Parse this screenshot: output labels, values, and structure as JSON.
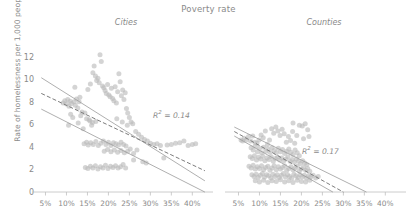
{
  "chart_data": {
    "type": "scatter",
    "title": "Poverty rate",
    "xlabel": "",
    "ylabel": "Rate of homelessness per 1,000 people",
    "xlim": [
      2.5,
      43.5
    ],
    "ylim": [
      -0.4,
      12.8
    ],
    "grid": false,
    "legend": "none",
    "xticks": [
      "5%",
      "10%",
      "15%",
      "20%",
      "25%",
      "30%",
      "35%",
      "40%"
    ],
    "xtick_values": [
      5,
      10,
      15,
      20,
      25,
      30,
      35,
      40
    ],
    "yticks": [
      "0",
      "2",
      "4",
      "6",
      "8",
      "10",
      "12"
    ],
    "ytick_values": [
      0,
      2,
      4,
      6,
      8,
      10,
      12
    ],
    "panels": [
      {
        "name": "cities",
        "label": "Cities",
        "r2_text": "R² = 0.14",
        "r2_value": 0.14,
        "fit_line": {
          "style": "dashed",
          "x": [
            4.0,
            43.0
          ],
          "y": [
            8.75,
            1.85
          ]
        },
        "bound_upper": {
          "style": "solid",
          "x": [
            4.0,
            43.0
          ],
          "y": [
            10.15,
            0.95
          ]
        },
        "bound_lower": {
          "style": "solid",
          "x": [
            4.0,
            43.0
          ],
          "y": [
            7.35,
            -0.05
          ]
        },
        "points": [
          [
            9.2,
            7.9
          ],
          [
            9.6,
            8.1
          ],
          [
            10.0,
            7.8
          ],
          [
            10.3,
            8.2
          ],
          [
            10.6,
            7.6
          ],
          [
            10.9,
            8.05
          ],
          [
            11.2,
            7.85
          ],
          [
            11.5,
            6.6
          ],
          [
            11.8,
            8.0
          ],
          [
            12.1,
            7.7
          ],
          [
            12.4,
            8.25
          ],
          [
            12.7,
            7.45
          ],
          [
            13.0,
            8.0
          ],
          [
            13.4,
            6.75
          ],
          [
            13.7,
            7.1
          ],
          [
            14.0,
            5.6
          ],
          [
            14.4,
            7.0
          ],
          [
            14.8,
            6.5
          ],
          [
            15.1,
            9.1
          ],
          [
            15.4,
            6.4
          ],
          [
            15.7,
            9.6
          ],
          [
            16.0,
            5.9
          ],
          [
            16.3,
            10.6
          ],
          [
            16.6,
            11.2
          ],
          [
            16.9,
            10.3
          ],
          [
            17.2,
            9.9
          ],
          [
            17.5,
            10.1
          ],
          [
            17.8,
            9.7
          ],
          [
            18.0,
            12.2
          ],
          [
            18.3,
            11.6
          ],
          [
            18.6,
            9.4
          ],
          [
            18.9,
            9.25
          ],
          [
            19.2,
            9.0
          ],
          [
            19.5,
            8.75
          ],
          [
            19.8,
            9.55
          ],
          [
            20.1,
            8.6
          ],
          [
            20.4,
            8.45
          ],
          [
            20.7,
            9.2
          ],
          [
            21.0,
            8.3
          ],
          [
            21.3,
            8.1
          ],
          [
            21.6,
            9.35
          ],
          [
            21.9,
            7.9
          ],
          [
            22.2,
            8.9
          ],
          [
            22.5,
            10.5
          ],
          [
            22.8,
            9.8
          ],
          [
            23.1,
            8.55
          ],
          [
            23.4,
            9.05
          ],
          [
            23.7,
            8.2
          ],
          [
            24.0,
            8.8
          ],
          [
            24.3,
            7.4
          ],
          [
            24.6,
            7.0
          ],
          [
            25.0,
            6.6
          ],
          [
            25.4,
            6.2
          ],
          [
            25.8,
            6.05
          ],
          [
            15.6,
            6.3
          ],
          [
            16.2,
            6.15
          ],
          [
            17.0,
            6.25
          ],
          [
            14.2,
            4.25
          ],
          [
            14.8,
            4.4
          ],
          [
            15.2,
            4.15
          ],
          [
            15.8,
            4.35
          ],
          [
            16.4,
            4.2
          ],
          [
            17.0,
            4.45
          ],
          [
            17.6,
            4.1
          ],
          [
            18.2,
            4.3
          ],
          [
            18.8,
            4.5
          ],
          [
            19.4,
            4.2
          ],
          [
            20.0,
            4.4
          ],
          [
            20.6,
            4.1
          ],
          [
            21.2,
            4.35
          ],
          [
            21.8,
            4.25
          ],
          [
            22.4,
            4.15
          ],
          [
            23.0,
            4.4
          ],
          [
            23.6,
            4.2
          ],
          [
            24.2,
            4.05
          ],
          [
            19.0,
            3.6
          ],
          [
            19.8,
            3.75
          ],
          [
            20.6,
            3.55
          ],
          [
            21.4,
            3.7
          ],
          [
            22.2,
            3.5
          ],
          [
            23.0,
            3.65
          ],
          [
            23.8,
            3.45
          ],
          [
            24.6,
            3.6
          ],
          [
            25.2,
            3.8
          ],
          [
            26.0,
            3.4
          ],
          [
            26.8,
            3.7
          ],
          [
            14.5,
            2.15
          ],
          [
            15.1,
            2.05
          ],
          [
            15.7,
            2.25
          ],
          [
            16.3,
            2.1
          ],
          [
            16.9,
            2.3
          ],
          [
            17.5,
            2.0
          ],
          [
            18.1,
            2.2
          ],
          [
            18.7,
            2.1
          ],
          [
            19.3,
            2.35
          ],
          [
            19.9,
            2.05
          ],
          [
            20.5,
            2.25
          ],
          [
            21.1,
            2.15
          ],
          [
            21.7,
            2.3
          ],
          [
            22.3,
            2.1
          ],
          [
            22.9,
            2.2
          ],
          [
            23.5,
            2.4
          ],
          [
            24.1,
            2.1
          ],
          [
            26.5,
            5.35
          ],
          [
            27.2,
            5.1
          ],
          [
            27.9,
            4.85
          ],
          [
            28.6,
            4.65
          ],
          [
            29.3,
            4.5
          ],
          [
            30.0,
            4.3
          ],
          [
            30.8,
            4.2
          ],
          [
            31.6,
            4.25
          ],
          [
            32.4,
            4.1
          ],
          [
            33.2,
            3.0
          ],
          [
            34.0,
            4.15
          ],
          [
            35.0,
            4.2
          ],
          [
            36.0,
            4.3
          ],
          [
            37.0,
            4.35
          ],
          [
            38.0,
            4.5
          ],
          [
            39.0,
            4.1
          ],
          [
            40.0,
            4.2
          ],
          [
            40.8,
            4.25
          ],
          [
            26.0,
            2.8
          ],
          [
            28.2,
            2.65
          ],
          [
            29.0,
            2.55
          ],
          [
            22.0,
            6.5
          ],
          [
            23.3,
            6.2
          ],
          [
            24.5,
            5.9
          ],
          [
            12.0,
            9.3
          ],
          [
            13.2,
            8.4
          ],
          [
            11.0,
            6.9
          ],
          [
            12.8,
            6.1
          ],
          [
            10.5,
            5.9
          ]
        ]
      },
      {
        "name": "counties",
        "label": "Counties",
        "r2_text": "R² = 0.17",
        "r2_value": 0.17,
        "fit_line": {
          "style": "dashed",
          "x": [
            4.0,
            30.0
          ],
          "y": [
            5.35,
            -0.05
          ]
        },
        "bound_upper": {
          "style": "solid",
          "x": [
            4.0,
            35.5
          ],
          "y": [
            5.75,
            -0.05
          ]
        },
        "bound_lower": {
          "style": "solid",
          "x": [
            4.0,
            27.5
          ],
          "y": [
            4.95,
            -0.05
          ]
        },
        "points": [
          [
            6.4,
            4.75
          ],
          [
            6.9,
            4.6
          ],
          [
            7.4,
            4.9
          ],
          [
            7.9,
            4.5
          ],
          [
            8.4,
            4.95
          ],
          [
            8.9,
            4.4
          ],
          [
            9.4,
            4.3
          ],
          [
            9.9,
            4.6
          ],
          [
            10.4,
            5.05
          ],
          [
            10.9,
            4.8
          ],
          [
            11.4,
            5.4
          ],
          [
            11.9,
            4.2
          ],
          [
            12.4,
            4.6
          ],
          [
            12.9,
            5.6
          ],
          [
            13.4,
            5.2
          ],
          [
            13.9,
            5.75
          ],
          [
            14.4,
            5.4
          ],
          [
            14.9,
            5.0
          ],
          [
            15.4,
            5.55
          ],
          [
            15.9,
            5.15
          ],
          [
            16.4,
            4.4
          ],
          [
            16.9,
            4.9
          ],
          [
            17.4,
            4.55
          ],
          [
            17.9,
            5.35
          ],
          [
            18.4,
            4.3
          ],
          [
            18.9,
            5.0
          ],
          [
            19.5,
            5.9
          ],
          [
            20.2,
            5.85
          ],
          [
            20.9,
            6.05
          ],
          [
            21.5,
            5.5
          ],
          [
            18.0,
            6.1
          ],
          [
            8.0,
            3.9
          ],
          [
            8.5,
            3.7
          ],
          [
            9.0,
            4.05
          ],
          [
            9.5,
            3.55
          ],
          [
            10.0,
            3.85
          ],
          [
            10.5,
            3.45
          ],
          [
            11.0,
            3.95
          ],
          [
            11.5,
            3.6
          ],
          [
            12.0,
            3.8
          ],
          [
            12.5,
            3.5
          ],
          [
            13.0,
            3.9
          ],
          [
            13.5,
            3.65
          ],
          [
            14.0,
            3.45
          ],
          [
            14.5,
            3.85
          ],
          [
            15.0,
            3.55
          ],
          [
            15.5,
            3.75
          ],
          [
            16.0,
            3.4
          ],
          [
            16.5,
            3.6
          ],
          [
            17.0,
            3.8
          ],
          [
            17.5,
            3.5
          ],
          [
            18.0,
            3.3
          ],
          [
            18.5,
            3.7
          ],
          [
            19.0,
            3.45
          ],
          [
            19.5,
            3.2
          ],
          [
            7.8,
            3.1
          ],
          [
            8.3,
            2.95
          ],
          [
            8.8,
            3.2
          ],
          [
            9.3,
            2.8
          ],
          [
            9.8,
            3.05
          ],
          [
            10.3,
            2.9
          ],
          [
            10.8,
            3.15
          ],
          [
            11.3,
            2.75
          ],
          [
            11.8,
            3.0
          ],
          [
            12.3,
            2.85
          ],
          [
            12.8,
            3.1
          ],
          [
            13.3,
            2.7
          ],
          [
            13.8,
            2.95
          ],
          [
            14.3,
            3.05
          ],
          [
            14.8,
            2.8
          ],
          [
            15.3,
            3.0
          ],
          [
            15.8,
            2.75
          ],
          [
            16.3,
            2.9
          ],
          [
            16.8,
            3.1
          ],
          [
            17.3,
            2.7
          ],
          [
            17.8,
            2.85
          ],
          [
            18.3,
            2.6
          ],
          [
            18.8,
            2.9
          ],
          [
            19.3,
            2.7
          ],
          [
            19.8,
            2.5
          ],
          [
            20.3,
            2.75
          ],
          [
            20.8,
            2.55
          ],
          [
            21.3,
            2.4
          ],
          [
            7.5,
            2.25
          ],
          [
            8.0,
            2.1
          ],
          [
            8.5,
            2.35
          ],
          [
            9.0,
            2.0
          ],
          [
            9.5,
            2.2
          ],
          [
            10.0,
            2.05
          ],
          [
            10.5,
            2.3
          ],
          [
            11.0,
            1.95
          ],
          [
            11.5,
            2.15
          ],
          [
            12.0,
            2.25
          ],
          [
            12.5,
            1.9
          ],
          [
            13.0,
            2.1
          ],
          [
            13.5,
            2.3
          ],
          [
            14.0,
            1.95
          ],
          [
            14.5,
            2.2
          ],
          [
            15.0,
            2.0
          ],
          [
            15.5,
            2.15
          ],
          [
            16.0,
            2.3
          ],
          [
            16.5,
            1.9
          ],
          [
            17.0,
            2.05
          ],
          [
            17.5,
            2.2
          ],
          [
            18.0,
            1.95
          ],
          [
            18.5,
            2.1
          ],
          [
            19.0,
            2.25
          ],
          [
            19.5,
            1.85
          ],
          [
            20.0,
            2.0
          ],
          [
            20.5,
            2.15
          ],
          [
            21.0,
            1.9
          ],
          [
            21.5,
            2.05
          ],
          [
            22.0,
            1.8
          ],
          [
            8.2,
            1.5
          ],
          [
            8.7,
            1.35
          ],
          [
            9.2,
            1.55
          ],
          [
            9.7,
            1.25
          ],
          [
            10.2,
            1.45
          ],
          [
            10.7,
            1.6
          ],
          [
            11.2,
            1.3
          ],
          [
            11.7,
            1.5
          ],
          [
            12.2,
            1.4
          ],
          [
            12.7,
            1.2
          ],
          [
            13.2,
            1.55
          ],
          [
            13.7,
            1.35
          ],
          [
            14.2,
            1.5
          ],
          [
            14.7,
            1.25
          ],
          [
            15.2,
            1.45
          ],
          [
            15.7,
            1.6
          ],
          [
            16.2,
            1.3
          ],
          [
            16.7,
            1.5
          ],
          [
            17.2,
            1.35
          ],
          [
            17.7,
            1.2
          ],
          [
            18.2,
            1.55
          ],
          [
            18.7,
            1.4
          ],
          [
            19.2,
            1.25
          ],
          [
            19.7,
            1.5
          ],
          [
            20.2,
            1.3
          ],
          [
            20.7,
            1.45
          ],
          [
            21.2,
            1.2
          ],
          [
            21.7,
            1.4
          ],
          [
            22.2,
            1.3
          ],
          [
            22.8,
            1.45
          ],
          [
            23.4,
            1.2
          ],
          [
            24.0,
            1.35
          ],
          [
            9.0,
            0.95
          ],
          [
            10.0,
            0.85
          ],
          [
            11.0,
            1.0
          ],
          [
            12.0,
            0.8
          ],
          [
            13.0,
            0.95
          ],
          [
            14.0,
            0.9
          ],
          [
            15.0,
            1.05
          ],
          [
            16.0,
            0.85
          ],
          [
            17.0,
            0.95
          ],
          [
            18.0,
            0.8
          ],
          [
            19.0,
            1.0
          ],
          [
            20.0,
            0.9
          ],
          [
            21.0,
            0.85
          ],
          [
            22.0,
            1.0
          ],
          [
            5.6,
            4.6
          ],
          [
            6.0,
            4.5
          ],
          [
            20.5,
            4.7
          ],
          [
            21.8,
            4.9
          ]
        ]
      }
    ]
  },
  "style": {
    "point_color": "#b9b9b9",
    "line_color": "#9a9a9a",
    "fit_color": "#7c7c7c",
    "axis_color": "#bfbfbf",
    "text_color": "#8a8a8a"
  }
}
